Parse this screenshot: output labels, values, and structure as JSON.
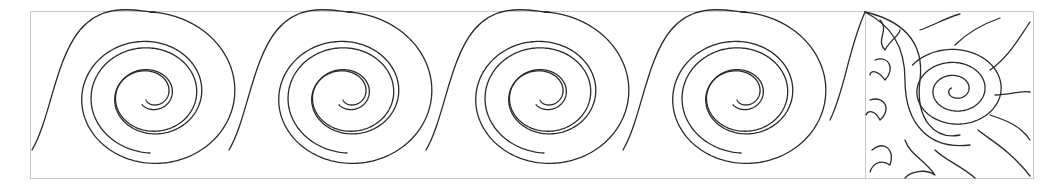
{
  "pattern": {
    "title": "Spiral border with sun corner block",
    "border": {
      "x": 30,
      "y": 11,
      "width": 1003,
      "height": 167,
      "color": "#c8c8c8"
    },
    "corner_divider_x": 865,
    "ink_color": "#2a2a2a",
    "spirals": [
      {
        "cx": 150,
        "cy": 95
      },
      {
        "cx": 347,
        "cy": 95
      },
      {
        "cx": 544,
        "cy": 95
      },
      {
        "cx": 741,
        "cy": 95
      }
    ],
    "corner_block": {
      "spiral_center": {
        "cx": 955,
        "cy": 90
      },
      "flame_count": 12
    }
  }
}
